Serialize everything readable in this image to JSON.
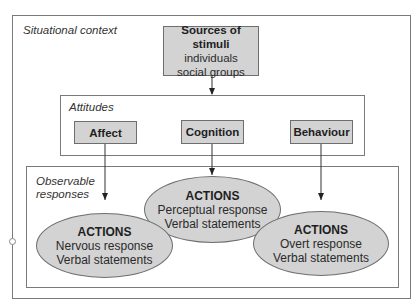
{
  "diagram": {
    "situational_context": {
      "label": "Situational context"
    },
    "sources": {
      "title": "Sources of stimuli",
      "lines": [
        "individuals",
        "social groups"
      ]
    },
    "attitudes": {
      "label": "Attitudes",
      "components": [
        {
          "label": "Affect"
        },
        {
          "label": "Cognition"
        },
        {
          "label": "Behaviour"
        }
      ]
    },
    "observable": {
      "label_line1": "Observable",
      "label_line2": "responses",
      "actions": [
        {
          "title": "ACTIONS",
          "lines": [
            "Nervous response",
            "Verbal statements"
          ]
        },
        {
          "title": "ACTIONS",
          "lines": [
            "Perceptual response",
            "Verbal statements"
          ]
        },
        {
          "title": "ACTIONS",
          "lines": [
            "Overt response",
            "Verbal statements"
          ]
        }
      ]
    },
    "edges": [
      {
        "from": "Sources of stimuli",
        "to": "Attitudes"
      },
      {
        "from": "Affect",
        "to": "ACTIONS (Nervous response)"
      },
      {
        "from": "Cognition",
        "to": "ACTIONS (Perceptual response)"
      },
      {
        "from": "Behaviour",
        "to": "ACTIONS (Overt response)"
      }
    ],
    "colors": {
      "fill": "#d3d3d3",
      "stroke": "#6e6e6e"
    }
  }
}
